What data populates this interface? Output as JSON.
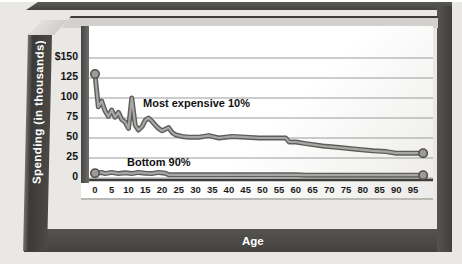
{
  "figure": {
    "y_axis_title": "Spending (in thousands)",
    "x_axis_title": "Age"
  },
  "colors": {
    "frame_dark": "#4b4a48",
    "grid": "#9b9b9b",
    "axis_line": "#3e3d3b",
    "line_outline": "#5e5d5b",
    "line_fill": "#a8a7a5",
    "marker_fill": "#9c9b99",
    "marker_stroke": "#504f4d",
    "page_bg": "#ffffff",
    "panel_bg": "#e9e8e5",
    "label_text": "#141414"
  },
  "chart_data": {
    "type": "line",
    "title": "",
    "xlabel": "Age",
    "ylabel": "Spending (in thousands)",
    "xlim": [
      0,
      100
    ],
    "ylim": [
      0,
      160
    ],
    "grid": "horizontal",
    "legend_position": "inline-annotations",
    "x_ticks": [
      0,
      5,
      10,
      15,
      20,
      25,
      30,
      35,
      40,
      45,
      50,
      55,
      60,
      65,
      70,
      75,
      80,
      85,
      90,
      95
    ],
    "y_ticks": [
      {
        "label": "$150",
        "value": 150
      },
      {
        "label": "125",
        "value": 125
      },
      {
        "label": "100",
        "value": 100
      },
      {
        "label": "75",
        "value": 75
      },
      {
        "label": "50",
        "value": 50
      },
      {
        "label": "25",
        "value": 25
      },
      {
        "label": "0",
        "value": 0
      }
    ],
    "series": [
      {
        "name": "Most expensive 10%",
        "end_markers": true,
        "points": [
          [
            0,
            130
          ],
          [
            1,
            89
          ],
          [
            2,
            96
          ],
          [
            3,
            84
          ],
          [
            4,
            77
          ],
          [
            5,
            85
          ],
          [
            6,
            76
          ],
          [
            7,
            82
          ],
          [
            8,
            73
          ],
          [
            9,
            70
          ],
          [
            10,
            62
          ],
          [
            11,
            100
          ],
          [
            12,
            66
          ],
          [
            13,
            60
          ],
          [
            14,
            64
          ],
          [
            15,
            72
          ],
          [
            16,
            75
          ],
          [
            17,
            71
          ],
          [
            18,
            66
          ],
          [
            19,
            62
          ],
          [
            20,
            59
          ],
          [
            21,
            61
          ],
          [
            22,
            63
          ],
          [
            23,
            57
          ],
          [
            24,
            54
          ],
          [
            26,
            52
          ],
          [
            28,
            51
          ],
          [
            31,
            51
          ],
          [
            34,
            53
          ],
          [
            37,
            50
          ],
          [
            41,
            52
          ],
          [
            45,
            51
          ],
          [
            49,
            50
          ],
          [
            53,
            50
          ],
          [
            57,
            50
          ],
          [
            58,
            45
          ],
          [
            60,
            45
          ],
          [
            63,
            43
          ],
          [
            68,
            40
          ],
          [
            73,
            38
          ],
          [
            78,
            36
          ],
          [
            83,
            34
          ],
          [
            87,
            33
          ],
          [
            90,
            31
          ],
          [
            95,
            31
          ],
          [
            98,
            31
          ]
        ]
      },
      {
        "name": "Bottom 90%",
        "end_markers": true,
        "points": [
          [
            0,
            6
          ],
          [
            2,
            7
          ],
          [
            3,
            5.5
          ],
          [
            5,
            7
          ],
          [
            7,
            5.5
          ],
          [
            9,
            6.5
          ],
          [
            11,
            5.5
          ],
          [
            13,
            7
          ],
          [
            15,
            6
          ],
          [
            17,
            5.5
          ],
          [
            19,
            7
          ],
          [
            21,
            6
          ],
          [
            22,
            4
          ],
          [
            30,
            4
          ],
          [
            40,
            4
          ],
          [
            50,
            4
          ],
          [
            60,
            4
          ],
          [
            63,
            3.5
          ],
          [
            70,
            3.5
          ],
          [
            80,
            3.5
          ],
          [
            90,
            3.5
          ],
          [
            95,
            3.5
          ],
          [
            98,
            3.5
          ]
        ]
      }
    ],
    "annotations": [
      {
        "text": "Most expensive 10%"
      },
      {
        "text": "Bottom 90%"
      }
    ]
  }
}
